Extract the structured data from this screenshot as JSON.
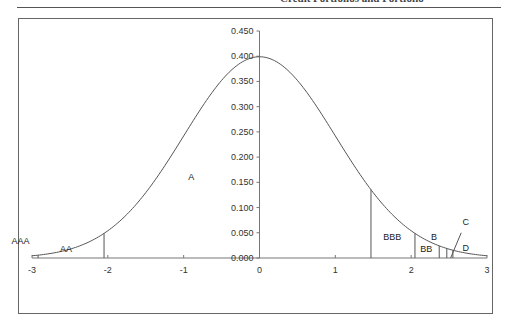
{
  "header": {
    "running_head": "Credit Portfolios and Portfolio"
  },
  "chart_data": {
    "type": "line",
    "title": "",
    "xlabel": "",
    "ylabel": "",
    "series": [
      {
        "name": "Standard normal density",
        "function": "normal_pdf",
        "mean": 0,
        "sd": 1
      }
    ],
    "xlim": [
      -3,
      3
    ],
    "ylim": [
      0,
      0.45
    ],
    "x_ticks": [
      "-3",
      "-2",
      "-1",
      "0",
      "1",
      "2",
      "3"
    ],
    "y_ticks": [
      "0.000",
      "0.050",
      "0.100",
      "0.150",
      "0.200",
      "0.250",
      "0.300",
      "0.350",
      "0.400",
      "0.450"
    ],
    "grid": false,
    "legend": "none",
    "thresholds": [
      {
        "x": -2.92,
        "label": "AAA/AA boundary"
      },
      {
        "x": -2.05,
        "label": "AA/A boundary"
      },
      {
        "x": 1.47,
        "label": "A/BBB boundary"
      },
      {
        "x": 2.05,
        "label": "BBB/BB boundary"
      },
      {
        "x": 2.37,
        "label": "BB/B boundary"
      },
      {
        "x": 2.47,
        "label": "B/C boundary"
      },
      {
        "x": 2.55,
        "label": "C/D boundary"
      }
    ],
    "region_labels": [
      {
        "text": "AAA",
        "x": -3.15,
        "y": 0.028
      },
      {
        "text": "AA",
        "x": -2.55,
        "y": 0.012
      },
      {
        "text": "A",
        "x": -0.9,
        "y": 0.155
      },
      {
        "text": "BBB",
        "x": 1.75,
        "y": 0.035
      },
      {
        "text": "BB",
        "x": 2.2,
        "y": 0.012
      },
      {
        "text": "B",
        "x": 2.3,
        "y": 0.036
      },
      {
        "text": "C",
        "x": 2.72,
        "y": 0.065
      },
      {
        "text": "D",
        "x": 2.72,
        "y": 0.013
      }
    ],
    "annotations": [
      {
        "type": "leader-line",
        "from": [
          2.52,
          0.0
        ],
        "to": [
          2.66,
          0.05
        ],
        "label": "C"
      }
    ]
  }
}
